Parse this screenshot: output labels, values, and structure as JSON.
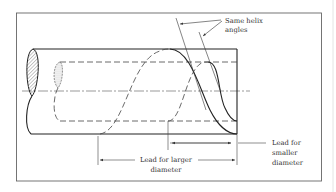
{
  "diagram": {
    "labels": {
      "helix_line1": "Same helix",
      "helix_line2": "angles",
      "smaller_line1": "Lead for",
      "smaller_line2": "smaller",
      "smaller_line3": "diameter",
      "larger_line1": "Lead for larger",
      "larger_line2": "diameter"
    },
    "colors": {
      "line": "#222222",
      "frame": "#555555",
      "background": "#ffffff"
    }
  }
}
